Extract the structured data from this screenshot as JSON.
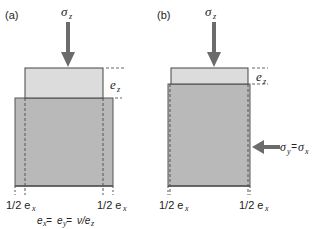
{
  "figure": {
    "panel_a": {
      "label": "(a)",
      "load_label": "σ",
      "load_sub": "z",
      "strain_label": "e",
      "strain_sub": "z",
      "left_bottom_label": "1/2 e",
      "left_bottom_sub": "x",
      "right_bottom_label": "1/2 e",
      "right_bottom_sub": "x",
      "equation": "eₓ = eᵧ = ν/e_z",
      "equation_parts": {
        "e1": "e",
        "s1": "x",
        "eq1": " = ",
        "e2": "e",
        "s2": "y",
        "eq2": " = ",
        "nu": "ν/e",
        "s3": "z"
      }
    },
    "panel_b": {
      "label": "(b)",
      "load_label": "σ",
      "load_sub": "z",
      "strain_label": "e",
      "strain_sub": "z",
      "lateral_label_1": "σ",
      "lateral_sub_1": "y",
      "lateral_eq": "=",
      "lateral_label_2": "σ",
      "lateral_sub_2": "x",
      "left_bottom_label": "1/2 e",
      "left_bottom_sub": "x",
      "right_bottom_label": "1/2 e",
      "right_bottom_sub": "x"
    },
    "colors": {
      "arrow": "#6b6b6b",
      "top_block": "#dcdcdc",
      "base_block": "#b9b9b9",
      "outline": "#444444",
      "text": "#222222"
    }
  }
}
